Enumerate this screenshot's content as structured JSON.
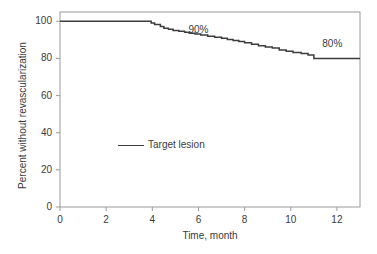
{
  "chart_data": {
    "type": "line",
    "title": "",
    "subtitle": "",
    "xlabel": "Time, month",
    "ylabel": "Percent without revascularization",
    "xlim": [
      0,
      13
    ],
    "ylim": [
      0,
      105
    ],
    "grid": false,
    "legend_position": "inside-left",
    "xticks": [
      0,
      2,
      4,
      6,
      8,
      10,
      12
    ],
    "xtick_labels": [
      "0",
      "2",
      "4",
      "6",
      "8",
      "10",
      "12"
    ],
    "yticks": [
      0,
      20,
      40,
      60,
      80,
      100
    ],
    "ytick_labels": [
      "0",
      "20",
      "40",
      "60",
      "80",
      "100"
    ],
    "series": [
      {
        "name": "Target lesion",
        "style": "step-post",
        "color": "#3c3c3c",
        "x": [
          0.0,
          3.15,
          3.95,
          4.1,
          4.35,
          4.5,
          4.7,
          4.9,
          5.15,
          5.4,
          5.6,
          5.85,
          6.1,
          6.4,
          6.7,
          7.0,
          7.25,
          7.5,
          7.75,
          8.0,
          8.3,
          8.6,
          8.9,
          9.2,
          9.5,
          9.8,
          10.1,
          10.45,
          10.75,
          11.0,
          13.0
        ],
        "y": [
          100.0,
          100.0,
          99.1,
          98.3,
          97.2,
          96.3,
          95.7,
          95.1,
          94.6,
          94.1,
          93.6,
          93.1,
          92.6,
          92.0,
          91.4,
          90.8,
          90.2,
          89.6,
          89.1,
          88.5,
          87.6,
          86.8,
          86.2,
          85.6,
          84.6,
          83.8,
          83.2,
          82.6,
          81.8,
          80.0,
          80.0
        ]
      }
    ],
    "annotations": [
      {
        "text": "90%",
        "x": 6.0,
        "y": 95.5
      },
      {
        "text": "80%",
        "x": 11.8,
        "y": 88.0
      }
    ]
  },
  "legend": {
    "entries": [
      {
        "label": "Target lesion",
        "color": "#3c3c3c"
      }
    ]
  },
  "axes": {
    "frame_color": "#9a9a9a",
    "tick_color": "#9a9a9a",
    "text_color": "#3a3a3a"
  }
}
